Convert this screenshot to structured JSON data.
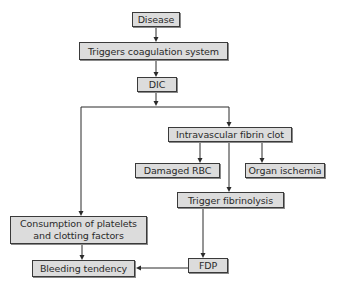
{
  "diagram": {
    "type": "flowchart",
    "nodes": {
      "disease": "Disease",
      "triggers_coagulation": "Triggers coagulation system",
      "dic": "DIC",
      "intravascular_clot": "Intravascular fibrin clot",
      "damaged_rbc": "Damaged RBC",
      "organ_ischemia": "Organ ischemia",
      "trigger_fibrinolysis": "Trigger fibrinolysis",
      "consumption_line1": "Consumption of platelets",
      "consumption_line2": "and clotting factors",
      "fdp": "FDP",
      "bleeding_tendency": "Bleeding tendency"
    },
    "edges": [
      {
        "from": "Disease",
        "to": "Triggers coagulation system"
      },
      {
        "from": "Triggers coagulation system",
        "to": "DIC"
      },
      {
        "from": "DIC",
        "to": "Intravascular fibrin clot"
      },
      {
        "from": "DIC",
        "to": "Consumption of platelets and clotting factors"
      },
      {
        "from": "Intravascular fibrin clot",
        "to": "Damaged RBC"
      },
      {
        "from": "Intravascular fibrin clot",
        "to": "Organ ischemia"
      },
      {
        "from": "Intravascular fibrin clot",
        "to": "Trigger fibrinolysis"
      },
      {
        "from": "Trigger fibrinolysis",
        "to": "FDP"
      },
      {
        "from": "Consumption of platelets and clotting factors",
        "to": "Bleeding tendency"
      },
      {
        "from": "FDP",
        "to": "Bleeding tendency"
      }
    ],
    "colors": {
      "node_fill": "#dcdcdc",
      "node_border": "#3a3a3a",
      "line": "#2a2a2a",
      "background": "#ffffff"
    }
  }
}
